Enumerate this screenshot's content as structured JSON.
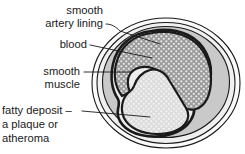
{
  "figure": {
    "background_color": "#ffffff",
    "text_color": "#1a1a1a",
    "colors": {
      "outer_wall_fill": "#f2f2f2",
      "adventitia_band": "#fbfbfb",
      "smooth_muscle_fill": "#c9c9c9",
      "blood_fill": "#9a9a9a",
      "blood_dots": "#e8e8e8",
      "plaque_fill": "#dedede",
      "plaque_dots": "#f4f4f4",
      "outline": "#1a1a1a"
    },
    "labels": [
      {
        "id": "smooth-artery-lining",
        "lines": [
          "smooth",
          "artery lining"
        ],
        "points_to": "endothelium",
        "text_anchor_x": 103,
        "line1_y": 14,
        "line2_y": 27
      },
      {
        "id": "blood",
        "lines": [
          "blood"
        ],
        "points_to": "blood-lumen",
        "text_anchor_x": 87,
        "line1_y": 48
      },
      {
        "id": "smooth-muscle",
        "lines": [
          "smooth",
          "muscle"
        ],
        "points_to": "smooth-muscle-layer",
        "text_anchor_x": 80,
        "line1_y": 75,
        "line2_y": 88
      },
      {
        "id": "fatty-deposit",
        "lines": [
          "fatty deposit –",
          "a plaque or",
          "atheroma"
        ],
        "points_to": "plaque",
        "text_anchor_x": 78,
        "line1_y": 114,
        "line2_y": 128,
        "line3_y": 142
      }
    ],
    "parts": [
      {
        "id": "outer-wall",
        "name": "artery outer wall"
      },
      {
        "id": "smooth-muscle-layer",
        "name": "smooth muscle"
      },
      {
        "id": "endothelium",
        "name": "smooth artery lining"
      },
      {
        "id": "blood-lumen",
        "name": "blood"
      },
      {
        "id": "plaque",
        "name": "fatty deposit / plaque / atheroma"
      }
    ]
  }
}
